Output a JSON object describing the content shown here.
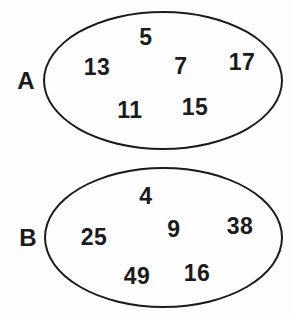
{
  "diagram": {
    "type": "set-diagram",
    "sets": [
      {
        "label": "A",
        "items": [
          "5",
          "13",
          "7",
          "17",
          "11",
          "15"
        ]
      },
      {
        "label": "B",
        "items": [
          "4",
          "25",
          "9",
          "38",
          "49",
          "16"
        ]
      }
    ]
  },
  "colors": {
    "ink": "#1b1b1b",
    "background": "#fdfdfd"
  }
}
